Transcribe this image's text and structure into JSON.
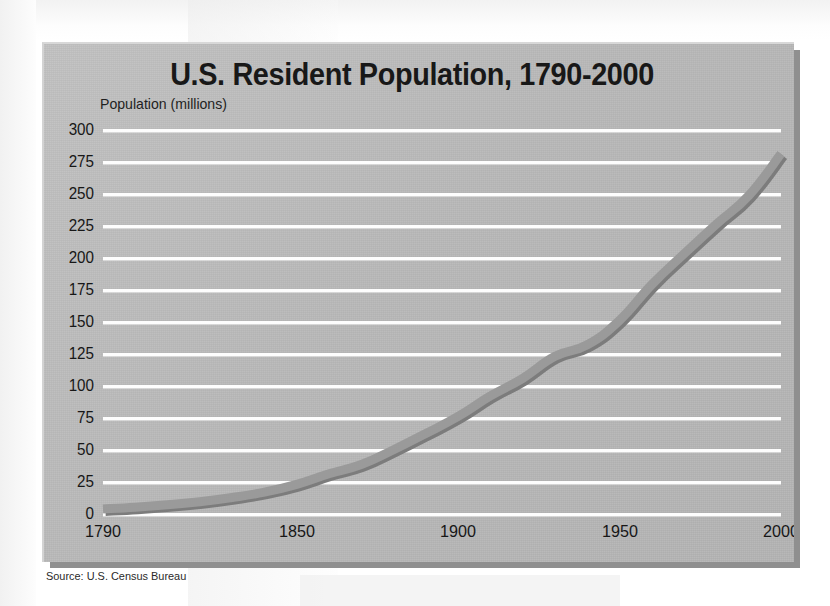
{
  "figure": {
    "source_note": "Source: U.S. Census Bureau"
  },
  "chart_data": {
    "type": "line",
    "title": "U.S. Resident Population, 1790-2000",
    "subtitle": "Population (millions)",
    "xlabel": "",
    "ylabel": "Population (millions)",
    "xlim": [
      1790,
      2000
    ],
    "ylim": [
      0,
      300
    ],
    "grid": true,
    "legend": "none",
    "xticks": [
      1790,
      1850,
      1900,
      1950,
      2000
    ],
    "xtick_labels": [
      "1790",
      "1850",
      "1900",
      "1950",
      "2000"
    ],
    "yticks": [
      0,
      25,
      50,
      75,
      100,
      125,
      150,
      175,
      200,
      225,
      250,
      275,
      300
    ],
    "ytick_labels": [
      "0",
      "25",
      "50",
      "75",
      "100",
      "125",
      "150",
      "175",
      "200",
      "225",
      "250",
      "275",
      "300"
    ],
    "series": [
      {
        "name": "U.S. Resident Population",
        "color": "#9a9a9a",
        "shadow_color": "#7c7c7c",
        "line_width": 9,
        "x": [
          1790,
          1800,
          1810,
          1820,
          1830,
          1840,
          1850,
          1860,
          1870,
          1880,
          1890,
          1900,
          1910,
          1920,
          1930,
          1940,
          1950,
          1960,
          1970,
          1980,
          1990,
          2000
        ],
        "values": [
          3.9,
          5.3,
          7.2,
          9.6,
          12.9,
          17.1,
          23.2,
          31.4,
          38.6,
          50.2,
          62.9,
          76.2,
          92.2,
          106.0,
          123.2,
          132.2,
          151.3,
          179.3,
          203.3,
          226.5,
          248.7,
          281.4
        ]
      }
    ],
    "annotations": []
  },
  "colors": {
    "panel_background": "#bcbcbc",
    "gridline": "#fdfdfd",
    "text": "#171717",
    "shadow": "#8f8f8f",
    "page_background": "#fbfbfb"
  }
}
